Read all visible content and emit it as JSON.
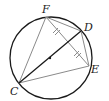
{
  "diagram": {
    "type": "circle-geometry",
    "circle": {
      "cx": 51,
      "cy": 58,
      "r": 41,
      "stroke": "#1a1a1a"
    },
    "center_dot": {
      "x": 50,
      "y": 58
    },
    "points": {
      "F": {
        "x": 46,
        "y": 17,
        "label": "F",
        "lx": 42,
        "ly": 13
      },
      "D": {
        "x": 81,
        "y": 31,
        "label": "D",
        "lx": 84,
        "ly": 31
      },
      "E": {
        "x": 89,
        "y": 66,
        "label": "E",
        "lx": 91,
        "ly": 73
      },
      "C": {
        "x": 19,
        "y": 83,
        "label": "C",
        "lx": 10,
        "ly": 95
      }
    },
    "segments": [
      {
        "from": "C",
        "to": "D",
        "color": "#1a1a1a",
        "note": "diameter"
      },
      {
        "from": "C",
        "to": "F",
        "color": "#8a8a8a"
      },
      {
        "from": "C",
        "to": "E",
        "color": "#8a8a8a"
      },
      {
        "from": "F",
        "to": "E",
        "color": "#8a8a8a"
      },
      {
        "from": "F",
        "to": "D",
        "color": "#8a8a8a"
      },
      {
        "from": "D",
        "to": "E",
        "color": "#8a8a8a"
      }
    ],
    "tick_marks": {
      "segment": "FE",
      "count": 2,
      "style": "double-tick",
      "note": "equal halves"
    }
  }
}
